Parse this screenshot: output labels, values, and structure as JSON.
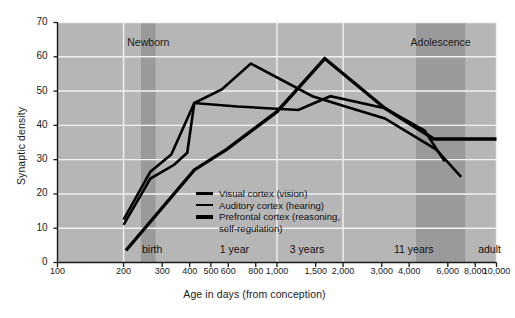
{
  "chart_data": {
    "type": "line",
    "title": "",
    "xlabel": "Age in days (from conception)",
    "ylabel": "Synaptic density",
    "xscale": "log",
    "xlim": [
      100,
      10000
    ],
    "ylim": [
      0,
      70
    ],
    "grid": true,
    "legend_position": "inside-center",
    "y_ticks": [
      0,
      10,
      20,
      30,
      40,
      50,
      60,
      70
    ],
    "x_ticks": [
      {
        "value": 100,
        "label": "100"
      },
      {
        "value": 200,
        "label": "200"
      },
      {
        "value": 300,
        "label": "300"
      },
      {
        "value": 400,
        "label": "400"
      },
      {
        "value": 500,
        "label": "500"
      },
      {
        "value": 600,
        "label": "600"
      },
      {
        "value": 800,
        "label": "800"
      },
      {
        "value": 1000,
        "label": "1,000"
      },
      {
        "value": 1500,
        "label": "1,500"
      },
      {
        "value": 2000,
        "label": "2,000"
      },
      {
        "value": 3000,
        "label": "3,000"
      },
      {
        "value": 4000,
        "label": "4,000"
      },
      {
        "value": 6000,
        "label": "6,000"
      },
      {
        "value": 8000,
        "label": "8,000"
      },
      {
        "value": 10000,
        "label": "10,000"
      }
    ],
    "annotations": [
      {
        "name": "newborn-band",
        "label": "Newborn",
        "type": "vband",
        "x_start": 240,
        "x_end": 280,
        "label_y": 64
      },
      {
        "name": "adolescence-band",
        "label": "Adolescence",
        "type": "vband",
        "x_start": 4300,
        "x_end": 7200,
        "label_y": 64
      },
      {
        "name": "birth-marker",
        "label": "birth",
        "type": "axis-note",
        "x": 270
      },
      {
        "name": "one-year-marker",
        "label": "1 year",
        "type": "axis-note",
        "x": 640
      },
      {
        "name": "three-years-marker",
        "label": "3 years",
        "type": "axis-note",
        "x": 1370
      },
      {
        "name": "eleven-years-marker",
        "label": "11 years",
        "type": "axis-note",
        "x": 4200
      },
      {
        "name": "adult-marker",
        "label": "adult",
        "type": "axis-note",
        "x": 9300
      }
    ],
    "series": [
      {
        "name": "Visual cortex (vision)",
        "label": "Visual cortex (vision)",
        "color": "#000000",
        "width": 2.6,
        "points": [
          {
            "x": 200,
            "y": 12.5
          },
          {
            "x": 265,
            "y": 26.5
          },
          {
            "x": 330,
            "y": 31.5
          },
          {
            "x": 420,
            "y": 46.5
          },
          {
            "x": 560,
            "y": 50.5
          },
          {
            "x": 760,
            "y": 58
          },
          {
            "x": 1450,
            "y": 48.5
          },
          {
            "x": 2050,
            "y": 45.5
          },
          {
            "x": 3100,
            "y": 42
          },
          {
            "x": 5300,
            "y": 33
          },
          {
            "x": 6900,
            "y": 25
          }
        ]
      },
      {
        "name": "Auditory cortex (hearing)",
        "label": "Auditory cortex (hearing)",
        "color": "#000000",
        "width": 2.6,
        "points": [
          {
            "x": 200,
            "y": 11
          },
          {
            "x": 265,
            "y": 24.5
          },
          {
            "x": 340,
            "y": 28.5
          },
          {
            "x": 390,
            "y": 32
          },
          {
            "x": 420,
            "y": 46.5
          },
          {
            "x": 660,
            "y": 45.5
          },
          {
            "x": 1250,
            "y": 44.5
          },
          {
            "x": 1750,
            "y": 48.5
          },
          {
            "x": 3100,
            "y": 45
          },
          {
            "x": 4700,
            "y": 38.5
          },
          {
            "x": 5800,
            "y": 29.5
          }
        ]
      },
      {
        "name": "Prefrontal cortex (reasoning, self-regulation)",
        "label": "Prefrontal cortex (reasoning, self-regulation)",
        "color": "#000000",
        "width": 3.4,
        "points": [
          {
            "x": 205,
            "y": 3.5
          },
          {
            "x": 420,
            "y": 27
          },
          {
            "x": 590,
            "y": 33
          },
          {
            "x": 1000,
            "y": 44
          },
          {
            "x": 1650,
            "y": 59.5
          },
          {
            "x": 3100,
            "y": 45
          },
          {
            "x": 5200,
            "y": 36
          },
          {
            "x": 10000,
            "y": 36
          }
        ]
      }
    ],
    "legend_entries": [
      "Visual cortex (vision)",
      "Auditory cortex (hearing)",
      "Prefrontal cortex (reasoning,",
      "self-regulation)"
    ]
  }
}
